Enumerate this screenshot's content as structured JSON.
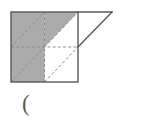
{
  "figure": {
    "colors": {
      "shade_gray": "#ababab",
      "outline_dark": "#595959",
      "dashed_gray": "#8c8c8c",
      "background_white": "#ffffff",
      "text_gray": "#5a5a5a"
    },
    "square": {
      "left": 11,
      "top": 12,
      "right": 78,
      "bottom": 82,
      "mid_x": 44.5,
      "mid_y": 47
    },
    "triangle": {
      "apex_x": 112,
      "apex_y": 12,
      "base_top_x": 78,
      "base_top_y": 12,
      "base_bottom_x": 78,
      "base_bottom_y": 47,
      "filled": false
    },
    "quadrants": [
      {
        "name": "top-left",
        "shaded": "full"
      },
      {
        "name": "top-right",
        "shaded": "upper-left-half"
      },
      {
        "name": "bottom-left",
        "shaded": "full"
      },
      {
        "name": "bottom-right",
        "shaded": "none"
      }
    ],
    "dashed_lines": [
      "vertical-midline",
      "horizontal-midline",
      "top-left-diagonal",
      "top-right-diagonal",
      "bottom-left-diagonal",
      "bottom-right-diagonal"
    ]
  },
  "answer": {
    "paren_label": "("
  }
}
